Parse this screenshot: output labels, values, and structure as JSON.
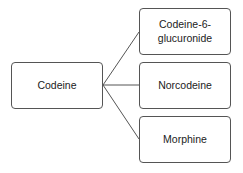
{
  "diagram": {
    "root": {
      "label": "Codeine"
    },
    "children": [
      {
        "label": "Codeine-6-\nglucuronide"
      },
      {
        "label": "Norcodeine"
      },
      {
        "label": "Morphine"
      }
    ]
  }
}
